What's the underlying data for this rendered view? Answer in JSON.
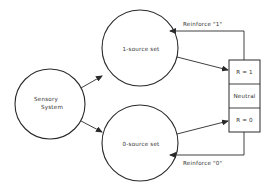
{
  "diagram": {
    "nodes": {
      "sensory": {
        "line1": "Sensory",
        "line2": "System"
      },
      "one_source": {
        "label": "1-source set"
      },
      "zero_source": {
        "label": "0-source set"
      }
    },
    "box": {
      "cells": [
        {
          "label": "R = 1"
        },
        {
          "label": "Neutral"
        },
        {
          "label": "R = 0"
        }
      ]
    },
    "feedback": {
      "top": {
        "label": "Reinforce \"1\""
      },
      "bottom": {
        "label": "Reinforce \"0\""
      }
    },
    "colors": {
      "line": "#2a2a2a",
      "text": "#333333",
      "background": "#ffffff"
    }
  }
}
